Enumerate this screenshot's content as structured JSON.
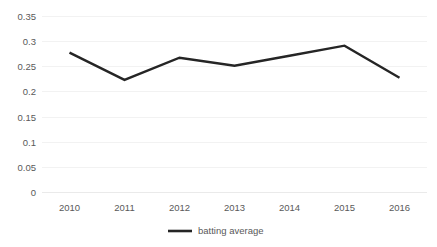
{
  "chart_data": {
    "type": "line",
    "title": "",
    "xlabel": "",
    "ylabel": "",
    "categories": [
      "2010",
      "2011",
      "2012",
      "2013",
      "2014",
      "2015",
      "2016"
    ],
    "series": [
      {
        "name": "batting average",
        "color": "#252525",
        "values": [
          0.278,
          0.224,
          0.268,
          0.252,
          0.272,
          0.292,
          0.228
        ]
      }
    ],
    "ylim": [
      0,
      0.35
    ],
    "yticks": [
      0,
      0.05,
      0.1,
      0.15,
      0.2,
      0.25,
      0.3,
      0.35
    ],
    "ytick_labels": [
      "0",
      "0.05",
      "0.1",
      "0.15",
      "0.2",
      "0.25",
      "0.3",
      "0.35"
    ],
    "grid": true,
    "grid_axis": "y",
    "grid_color": "#f2f2f2",
    "legend": {
      "position": "bottom-center",
      "entries": [
        "batting average"
      ]
    },
    "background_color": "#ffffff",
    "tick_label_color": "#595959"
  },
  "axes": {
    "y": {
      "t0": "0.35",
      "t1": "0.3",
      "t2": "0.25",
      "t3": "0.2",
      "t4": "0.15",
      "t5": "0.1",
      "t6": "0.05",
      "t7": "0"
    },
    "x": {
      "t0": "2010",
      "t1": "2011",
      "t2": "2012",
      "t3": "2013",
      "t4": "2014",
      "t5": "2015",
      "t6": "2016"
    }
  },
  "legend": {
    "series_label": "batting average"
  }
}
